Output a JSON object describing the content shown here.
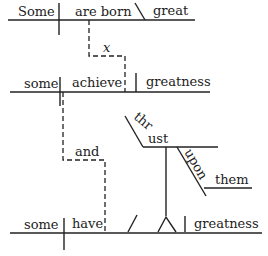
{
  "diagram": {
    "type": "sentence-diagram",
    "clause1": {
      "subject": "Some",
      "verb": "are born",
      "complement": "great"
    },
    "connector1": "x",
    "clause2": {
      "subject": "some",
      "verb": "achieve",
      "object": "greatness"
    },
    "connector2": "and",
    "clause3": {
      "subject": "some",
      "verb": "have",
      "object": "greatness",
      "participle": "thrust",
      "preposition": "upon",
      "prep_object": "them"
    }
  }
}
